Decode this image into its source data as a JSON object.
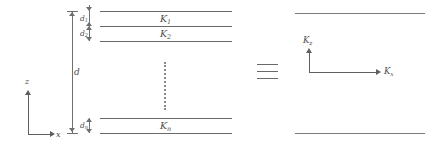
{
  "figure": {
    "left_diagram": {
      "axes": {
        "vertical_label": "z",
        "horizontal_label": "x"
      },
      "total_thickness_label": "d",
      "layers": [
        {
          "thickness_label": "d",
          "thickness_sub": "1",
          "medium_label": "K",
          "medium_sub": "1"
        },
        {
          "thickness_label": "d",
          "thickness_sub": "2",
          "medium_label": "K",
          "medium_sub": "2"
        },
        {
          "thickness_label": "d",
          "thickness_sub": "n",
          "medium_label": "K",
          "medium_sub": "n"
        }
      ],
      "ellipsis": "vertical-dots"
    },
    "equivalence_symbol": "identical-to",
    "right_diagram": {
      "axes": {
        "vertical_label": "K",
        "vertical_sub": "z",
        "horizontal_label": "K",
        "horizontal_sub": "x"
      }
    }
  }
}
